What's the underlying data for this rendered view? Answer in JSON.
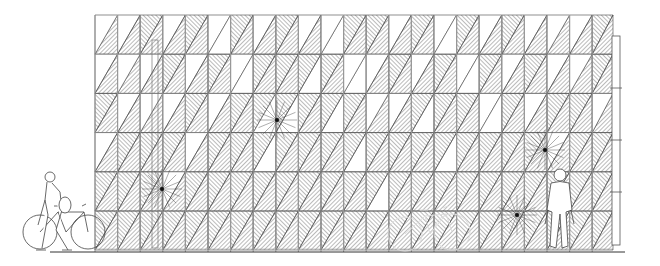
{
  "drawing": {
    "type": "architectural-elevation",
    "subject": "facade with triangulated hatched shading panels",
    "background": "#ffffff",
    "line_color": "#333333",
    "hatch_color": "#555555",
    "frame_color": "#9a9a9a",
    "ground_y": 252,
    "ground_x": [
      50,
      625
    ],
    "facade": {
      "x0": 95,
      "x1": 613,
      "top": 15,
      "bottom": 250
    },
    "posts": {
      "start_x": 95,
      "spacing": 22.6,
      "count": 23
    },
    "grid": {
      "col_width": 45.2,
      "row_height": 39.2,
      "rows": 6,
      "cols": 11
    },
    "open_triangles": [
      [
        0,
        1
      ],
      [
        0,
        3
      ],
      [
        0,
        5
      ],
      [
        0,
        7
      ],
      [
        0,
        9
      ],
      [
        0,
        10
      ],
      [
        0,
        13
      ],
      [
        0,
        15
      ],
      [
        0,
        17
      ],
      [
        0,
        19
      ],
      [
        0,
        21
      ],
      [
        1,
        0
      ],
      [
        1,
        2
      ],
      [
        1,
        4
      ],
      [
        1,
        6
      ],
      [
        1,
        9
      ],
      [
        1,
        11
      ],
      [
        1,
        12
      ],
      [
        1,
        14
      ],
      [
        1,
        16
      ],
      [
        1,
        18
      ],
      [
        1,
        20
      ],
      [
        2,
        1
      ],
      [
        2,
        3
      ],
      [
        2,
        5
      ],
      [
        2,
        8
      ],
      [
        2,
        10
      ],
      [
        2,
        13
      ],
      [
        2,
        14
      ],
      [
        2,
        17
      ],
      [
        2,
        19
      ],
      [
        3,
        0
      ],
      [
        3,
        4
      ],
      [
        3,
        7
      ],
      [
        3,
        11
      ],
      [
        3,
        15
      ],
      [
        3,
        20
      ],
      [
        4,
        3
      ],
      [
        4,
        12
      ]
    ],
    "downpipe": {
      "x": 612,
      "top": 36,
      "bottom": 245,
      "width": 8
    },
    "door_frame": {
      "x": 152,
      "top": 40,
      "bottom": 248
    },
    "hubs": [
      [
        162,
        189
      ],
      [
        277,
        120
      ],
      [
        545,
        150
      ],
      [
        517,
        215
      ]
    ]
  },
  "figures": [
    {
      "name": "pedestrian-with-bicycle-left",
      "x": 50,
      "y": 170
    },
    {
      "name": "parked-bicycle-center",
      "x": 385,
      "y": 205
    },
    {
      "name": "man-standing-right",
      "x": 548,
      "y": 165
    }
  ]
}
